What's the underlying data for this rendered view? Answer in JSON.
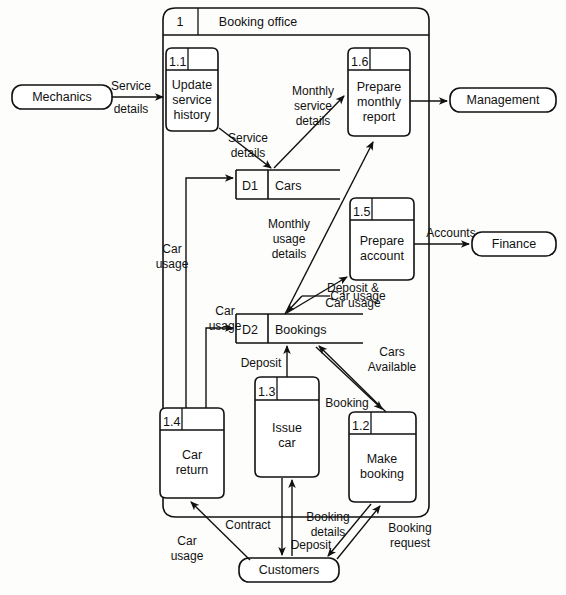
{
  "diagram": {
    "type": "data-flow-diagram",
    "system_boundary": {
      "number": "1",
      "title": "Booking office"
    },
    "processes": [
      {
        "id": "p11",
        "number": "1.1",
        "lines": [
          "Update",
          "service",
          "history"
        ]
      },
      {
        "id": "p16",
        "number": "1.6",
        "lines": [
          "Prepare",
          "monthly",
          "report"
        ]
      },
      {
        "id": "p15",
        "number": "1.5",
        "lines": [
          "Prepare",
          "account"
        ]
      },
      {
        "id": "p14",
        "number": "1.4",
        "lines": [
          "Car",
          "return"
        ]
      },
      {
        "id": "p13",
        "number": "1.3",
        "lines": [
          "Issue",
          "car"
        ]
      },
      {
        "id": "p12",
        "number": "1.2",
        "lines": [
          "Make",
          "booking"
        ]
      }
    ],
    "data_stores": [
      {
        "id": "d1",
        "code": "D1",
        "label": "Cars"
      },
      {
        "id": "d2",
        "code": "D2",
        "label": "Bookings"
      }
    ],
    "external_entities": [
      {
        "id": "mechanics",
        "label": "Mechanics"
      },
      {
        "id": "management",
        "label": "Management"
      },
      {
        "id": "finance",
        "label": "Finance"
      },
      {
        "id": "customers",
        "label": "Customers"
      }
    ],
    "flows": [
      {
        "id": "f1",
        "lines": [
          "Service",
          "details"
        ]
      },
      {
        "id": "f2",
        "lines": [
          "Monthly",
          "service",
          "details"
        ]
      },
      {
        "id": "f3",
        "lines": [
          "Service",
          "details"
        ]
      },
      {
        "id": "f4",
        "lines": [
          "Monthly",
          "usage",
          "details"
        ]
      },
      {
        "id": "f5",
        "lines": [
          "Accounts"
        ]
      },
      {
        "id": "f6",
        "lines": [
          "Deposit &",
          "Car usage"
        ]
      },
      {
        "id": "f7",
        "lines": [
          "Car",
          "usage"
        ]
      },
      {
        "id": "f8",
        "lines": [
          "Car",
          "usage"
        ]
      },
      {
        "id": "f9",
        "lines": [
          "Car usage"
        ]
      },
      {
        "id": "f10",
        "lines": [
          "Deposit"
        ]
      },
      {
        "id": "f11",
        "lines": [
          "Cars",
          "Available"
        ]
      },
      {
        "id": "f12",
        "lines": [
          "Booking"
        ]
      },
      {
        "id": "f13",
        "lines": [
          "Contract"
        ]
      },
      {
        "id": "f14",
        "lines": [
          "Deposit"
        ]
      },
      {
        "id": "f15",
        "lines": [
          "Booking",
          "details"
        ]
      },
      {
        "id": "f16",
        "lines": [
          "Booking",
          "request"
        ]
      },
      {
        "id": "f17",
        "lines": [
          "Car",
          "usage"
        ]
      }
    ]
  }
}
